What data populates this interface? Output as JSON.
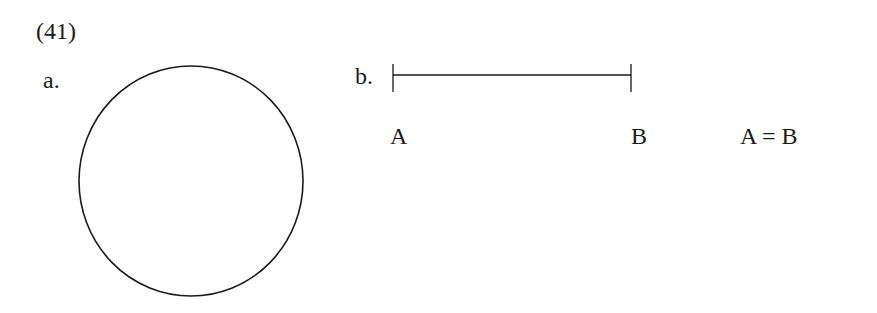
{
  "example_number": "(41)",
  "panel_a": {
    "label": "a.",
    "shape": "circle"
  },
  "panel_b": {
    "label": "b.",
    "shape": "line-segment",
    "endpoint_left": "A",
    "endpoint_right": "B",
    "equation": "A = B"
  },
  "colors": {
    "stroke": "#1a1a1a",
    "background": "#ffffff"
  }
}
